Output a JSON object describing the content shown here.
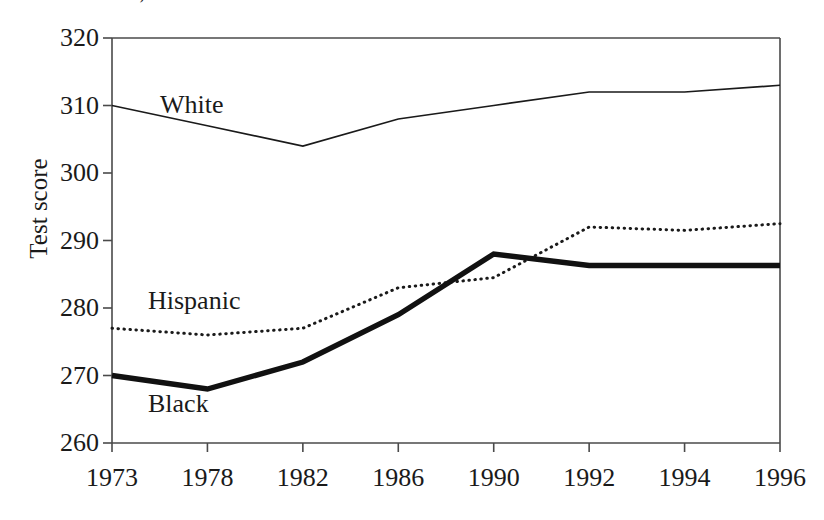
{
  "page": {
    "truncated_heading": "Achievement Scores, 1996"
  },
  "chart_data": {
    "type": "line",
    "title": "",
    "subtitle": "",
    "xlabel": "",
    "ylabel": "Test score",
    "categories": [
      "1973",
      "1978",
      "1982",
      "1986",
      "1990",
      "1992",
      "1994",
      "1996"
    ],
    "ylim": [
      260,
      320
    ],
    "yticks": [
      260,
      270,
      280,
      290,
      300,
      310,
      320
    ],
    "ytick_labels": [
      "260",
      "270",
      "280",
      "290",
      "300",
      "310",
      "320"
    ],
    "grid": false,
    "legend_position": "inline-labels",
    "series": [
      {
        "name": "White",
        "style": "thin-solid",
        "color": "#1a1a1a",
        "values": [
          310,
          307,
          304,
          308,
          310,
          312,
          312,
          313
        ]
      },
      {
        "name": "Hispanic",
        "style": "dotted",
        "color": "#1a1a1a",
        "values": [
          277,
          276,
          277,
          283,
          284.5,
          292,
          291.5,
          292.5
        ]
      },
      {
        "name": "Black",
        "style": "thick-solid",
        "color": "#111111",
        "values": [
          270,
          268,
          272,
          279,
          288,
          286.3,
          286.3,
          286.3
        ]
      }
    ],
    "annotations": [
      {
        "text": "White",
        "series": "White"
      },
      {
        "text": "Hispanic",
        "series": "Hispanic"
      },
      {
        "text": "Black",
        "series": "Black"
      }
    ]
  }
}
